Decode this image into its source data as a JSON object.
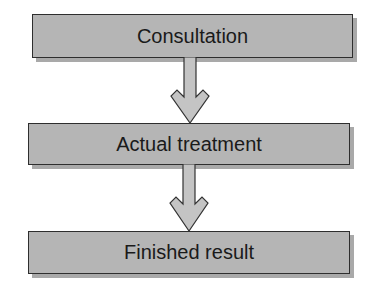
{
  "diagram": {
    "type": "flowchart",
    "direction": "top-to-bottom",
    "steps": [
      {
        "label": "Consultation"
      },
      {
        "label": "Actual treatment"
      },
      {
        "label": "Finished result"
      }
    ],
    "connections": [
      {
        "from": "Consultation",
        "to": "Actual treatment"
      },
      {
        "from": "Actual treatment",
        "to": "Finished result"
      }
    ],
    "colors": {
      "box_fill": "#b5b5b5",
      "box_border": "#2e2e2e",
      "box_shadow": "#a9a9a9",
      "arrow_fill": "#c4c4c4",
      "arrow_stroke": "#333333",
      "text": "#1a1a1a"
    }
  }
}
